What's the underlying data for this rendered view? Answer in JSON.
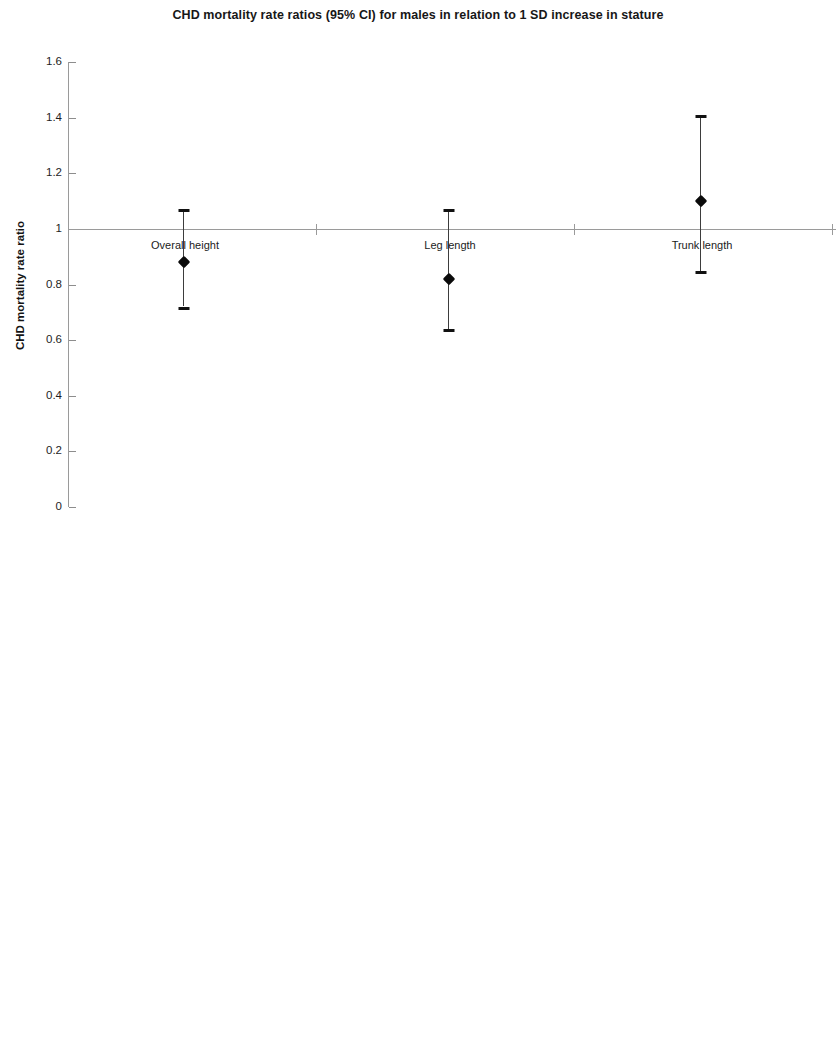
{
  "chart_data": [
    {
      "type": "scatter",
      "title": "CHD mortality rate ratios (95% CI) for males in relation to 1 SD increase in stature",
      "xlabel": "",
      "ylabel": "CHD mortality rate ratio",
      "categories": [
        "Overall height",
        "Leg length",
        "Trunk length"
      ],
      "values": [
        0.88,
        0.82,
        1.1
      ],
      "ci_lower": [
        0.72,
        0.64,
        0.85
      ],
      "ci_upper": [
        1.07,
        1.07,
        1.41
      ],
      "ylim": [
        0,
        1.6
      ],
      "yticks": [
        "0",
        "0.2",
        "0.4",
        "0.6",
        "0.8",
        "1",
        "1.2",
        "1.4",
        "1.6"
      ],
      "ytick_values": [
        0,
        0.2,
        0.4,
        0.6,
        0.8,
        1,
        1.2,
        1.4,
        1.6
      ],
      "reference_line": 1,
      "grid": false,
      "legend": "none",
      "error_bars": "95% CI"
    },
    {
      "type": "scatter",
      "title": "CHD mortality rate ratios (95% CI) for females in relation to 1 SD increase in stature",
      "xlabel": "",
      "ylabel": "CHD mortality rate ratio",
      "categories": [
        "Overall height",
        "Leg length",
        "Trunk length"
      ],
      "values": [
        0.56,
        0.54,
        1.01
      ],
      "ci_lower": [
        0.37,
        0.35,
        0.65
      ],
      "ci_upper": [
        0.86,
        0.83,
        1.58
      ],
      "ylim": [
        0,
        1.6
      ],
      "yticks": [
        "0",
        "0.2",
        "0.4",
        "0.6",
        "0.8",
        "1",
        "1.2",
        "1.4",
        "1.6"
      ],
      "ytick_values": [
        0,
        0.2,
        0.4,
        0.6,
        0.8,
        1,
        1.2,
        1.4,
        1.6
      ],
      "reference_line": 1,
      "grid": false,
      "legend": "none",
      "error_bars": "95% CI"
    }
  ],
  "panels": {
    "males": {
      "title": "CHD mortality rate ratios (95% CI) for males in relation to 1 SD increase in stature",
      "ylabel": "CHD mortality rate ratio",
      "yticks": [
        "1.6",
        "1.4",
        "1.2",
        "1",
        "0.8",
        "0.6",
        "0.4",
        "0.2",
        "0"
      ],
      "categories": [
        "Overall height",
        "Leg length",
        "Trunk length"
      ]
    },
    "females": {
      "title": "CHD mortality rate ratios (95% CI) for females in relation to 1 SD increase in stature",
      "ylabel": "CHD mortality rate ratio",
      "yticks": [
        "1.6",
        "1.4",
        "1.2",
        "1",
        "0.8",
        "0.6",
        "0.4",
        "0.2",
        "0"
      ],
      "categories": [
        "Overall height",
        "Leg length",
        "Trunk length"
      ]
    }
  },
  "colors": {
    "marker": "#0b0b0b",
    "axis": "#9a9a9a",
    "text": "#1a1a1a",
    "background": "#ffffff"
  }
}
